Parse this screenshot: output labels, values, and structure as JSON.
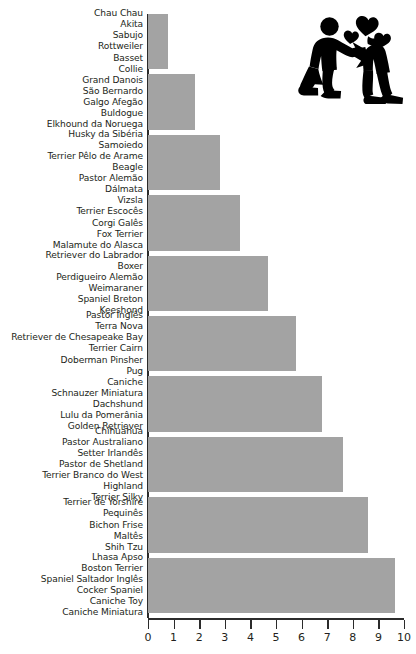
{
  "chart_data": {
    "type": "bar",
    "orientation": "horizontal",
    "title": "",
    "xlabel": "",
    "ylabel": "",
    "xlim": [
      0,
      10
    ],
    "xticks": [
      0,
      1,
      2,
      3,
      4,
      5,
      6,
      7,
      8,
      9,
      10
    ],
    "xtick_labels": [
      "0",
      "1",
      "2",
      "3",
      "4",
      "5",
      "6",
      "7",
      "8",
      "9",
      "10"
    ],
    "grid": false,
    "legend": null,
    "bar_color": "#a3a3a3",
    "axis_color": "#2b2b2b",
    "text_color": "#231f20",
    "categories": [
      "Chau Chau\nAkita\nSabujo\nRottweiler\nBasset\nCollie",
      "Grand Danois\nSão Bernardo\nGalgo Afegão\nBuldogue\nElkhound da Noruega",
      "Husky da Sibéria\nSamoiedo\nTerrier Pêlo de Arame\nBeagle\nPastor Alemão\nDálmata",
      "Vizsla\nTerrier Escocês\nCorgi Galês\nFox Terrier\nMalamute do Alasca",
      "Retriever do Labrador\nBoxer\nPerdigueiro Alemão\nWeimaraner\nSpaniel Breton\nKeeshond",
      "Pastor Inglês\nTerra Nova\nRetriever de Chesapeake Bay\nTerrier Cairn\nDoberman Pinsher\nPug",
      "Caniche\nSchnauzer Miniatura\nDachshund\nLulu da Pomerânia\nGolden Retriever",
      "Chihuahua\nPastor Australiano\nSetter Irlandês\nPastor de Shetland\nTerrier Branco do West\nHighland\nTerrier Silky",
      "Terrier de Yorshire\nPequinês\nBichon Frise\nMaltês\nShih Tzu",
      "Lhasa Apso\nBoston Terrier\nSpaniel Saltador Inglês\nCocker Spaniel\nCaniche Toy\nCaniche Miniatura"
    ],
    "values": [
      0.8,
      1.85,
      2.8,
      3.6,
      4.7,
      5.8,
      6.8,
      7.6,
      8.6,
      9.65
    ]
  },
  "pictogram": {
    "name": "proposal-couple-hearts-icon",
    "color": "#000000"
  }
}
